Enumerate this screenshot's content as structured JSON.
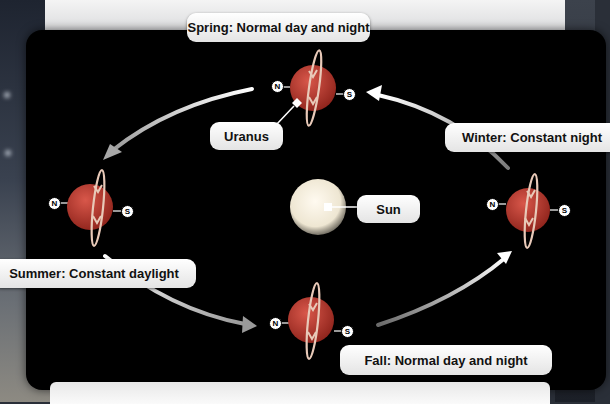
{
  "diagram": {
    "colors": {
      "panel_background": "#000000",
      "planet": "#b2342a",
      "planet_highlight": "#d8574a",
      "ring": "#e8c9b8",
      "arrow": "#f2f2f2",
      "sun": "#f3eee0",
      "label_bg": "#f2f2f2",
      "label_text": "#111111"
    },
    "labels": {
      "spring": "Spring: Normal day and night",
      "summer": "Summer: Constant daylight",
      "fall": "Fall: Normal day and night",
      "winter": "Winter: Constant night",
      "uranus": "Uranus",
      "sun": "Sun"
    },
    "poles": {
      "north": "N",
      "south": "S"
    },
    "planets": [
      {
        "season": "spring",
        "cx": 313,
        "cy": 88,
        "r": 23
      },
      {
        "season": "summer",
        "cx": 90,
        "cy": 207,
        "r": 23
      },
      {
        "season": "fall",
        "cx": 311,
        "cy": 320,
        "r": 23
      },
      {
        "season": "winter",
        "cx": 528,
        "cy": 210,
        "r": 22
      }
    ],
    "sun": {
      "cx": 318,
      "cy": 207,
      "r": 27
    }
  }
}
